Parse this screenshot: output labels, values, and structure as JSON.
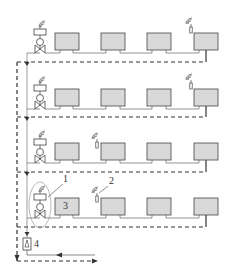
{
  "diagram": {
    "type": "heating-system-schematic",
    "colors": {
      "radiator_fill": "#d9d9d9",
      "line": "#444444",
      "background": "#ffffff"
    },
    "floors": [
      {
        "index": 1,
        "label": "floor-1",
        "radiators": 4,
        "wireless_sensor_at_radiator": 4
      },
      {
        "index": 2,
        "label": "floor-2",
        "radiators": 4,
        "wireless_sensor_at_radiator": 4
      },
      {
        "index": 3,
        "label": "floor-3",
        "radiators": 4,
        "wireless_sensor_at_radiator": 1
      },
      {
        "index": 4,
        "label": "floor-4",
        "radiators": 4,
        "wireless_sensor_at_radiator": 1
      }
    ],
    "callouts": {
      "valve_assembly": "1",
      "wireless_sensor": "2",
      "radiator": "3",
      "pump": "4"
    }
  }
}
